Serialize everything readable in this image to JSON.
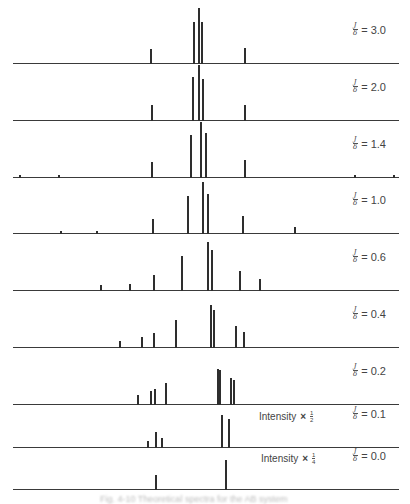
{
  "chart_data": {
    "type": "bar",
    "title": "",
    "xlabel": "",
    "ylabel": "",
    "x_axis": {
      "pixel_range": [
        13,
        399
      ],
      "ticks": "none"
    },
    "grid": false,
    "legend": null,
    "panels": [
      {
        "label_num": "J",
        "label_den": "δ",
        "label_value": "= 3.0",
        "ratio": 3.0,
        "baseline_y": 63,
        "intensity_note": null,
        "peaks": [
          {
            "x": 151,
            "h": 14
          },
          {
            "x": 194,
            "h": 41
          },
          {
            "x": 199,
            "h": 55
          },
          {
            "x": 202,
            "h": 41
          },
          {
            "x": 245,
            "h": 15
          }
        ]
      },
      {
        "label_num": "J",
        "label_den": "δ",
        "label_value": "= 2.0",
        "ratio": 2.0,
        "baseline_y": 120,
        "intensity_note": null,
        "peaks": [
          {
            "x": 152,
            "h": 15
          },
          {
            "x": 193,
            "h": 43
          },
          {
            "x": 199,
            "h": 55
          },
          {
            "x": 203,
            "h": 41
          },
          {
            "x": 245,
            "h": 15
          }
        ]
      },
      {
        "label_num": "J",
        "label_den": "δ",
        "label_value": "= 1.4",
        "ratio": 1.4,
        "baseline_y": 177,
        "intensity_note": null,
        "peaks": [
          {
            "x": 20,
            "h": 2
          },
          {
            "x": 59,
            "h": 2
          },
          {
            "x": 152,
            "h": 15
          },
          {
            "x": 191,
            "h": 42
          },
          {
            "x": 201,
            "h": 55
          },
          {
            "x": 206,
            "h": 44
          },
          {
            "x": 245,
            "h": 17
          },
          {
            "x": 355,
            "h": 2
          },
          {
            "x": 394,
            "h": 2
          }
        ]
      },
      {
        "label_num": "J",
        "label_den": "δ",
        "label_value": "= 1.0",
        "ratio": 1.0,
        "baseline_y": 233,
        "intensity_note": null,
        "peaks": [
          {
            "x": 61,
            "h": 2
          },
          {
            "x": 97,
            "h": 2
          },
          {
            "x": 153,
            "h": 14
          },
          {
            "x": 188,
            "h": 37
          },
          {
            "x": 203,
            "h": 51
          },
          {
            "x": 208,
            "h": 39
          },
          {
            "x": 243,
            "h": 17
          },
          {
            "x": 295,
            "h": 6
          }
        ]
      },
      {
        "label_num": "J",
        "label_den": "δ",
        "label_value": "= 0.6",
        "ratio": 0.6,
        "baseline_y": 290,
        "intensity_note": null,
        "peaks": [
          {
            "x": 101,
            "h": 5
          },
          {
            "x": 130,
            "h": 6
          },
          {
            "x": 154,
            "h": 15
          },
          {
            "x": 182,
            "h": 34
          },
          {
            "x": 208,
            "h": 48
          },
          {
            "x": 212,
            "h": 40
          },
          {
            "x": 240,
            "h": 19
          },
          {
            "x": 260,
            "h": 11
          }
        ]
      },
      {
        "label_num": "J",
        "label_den": "δ",
        "label_value": "= 0.4",
        "ratio": 0.4,
        "baseline_y": 347,
        "intensity_note": null,
        "peaks": [
          {
            "x": 120,
            "h": 6
          },
          {
            "x": 142,
            "h": 10
          },
          {
            "x": 154,
            "h": 14
          },
          {
            "x": 176,
            "h": 27
          },
          {
            "x": 211,
            "h": 42
          },
          {
            "x": 214,
            "h": 37
          },
          {
            "x": 236,
            "h": 21
          },
          {
            "x": 244,
            "h": 15
          }
        ]
      },
      {
        "label_num": "J",
        "label_den": "δ",
        "label_value": "= 0.2",
        "ratio": 0.2,
        "baseline_y": 404,
        "intensity_note": null,
        "peaks": [
          {
            "x": 138,
            "h": 9
          },
          {
            "x": 151,
            "h": 13
          },
          {
            "x": 155,
            "h": 15
          },
          {
            "x": 166,
            "h": 21
          },
          {
            "x": 218,
            "h": 35
          },
          {
            "x": 220,
            "h": 34
          },
          {
            "x": 231,
            "h": 26
          },
          {
            "x": 234,
            "h": 24
          }
        ]
      },
      {
        "label_num": "J",
        "label_den": "δ",
        "label_value": "= 0.1",
        "ratio": 0.1,
        "baseline_y": 447,
        "intensity_note": {
          "text": "Intensity",
          "times": "×",
          "num": "1",
          "den": "2"
        },
        "peaks": [
          {
            "x": 148,
            "h": 6
          },
          {
            "x": 156,
            "h": 15
          },
          {
            "x": 162,
            "h": 9
          },
          {
            "x": 222,
            "h": 32
          },
          {
            "x": 229,
            "h": 28
          }
        ]
      },
      {
        "label_num": "J",
        "label_den": "δ",
        "label_value": "= 0.0",
        "ratio": 0.0,
        "baseline_y": 489,
        "intensity_note": {
          "text": "Intensity",
          "times": "×",
          "num": "1",
          "den": "4"
        },
        "peaks": [
          {
            "x": 156,
            "h": 14
          },
          {
            "x": 226,
            "h": 29
          }
        ]
      }
    ]
  },
  "caption": "Fig. 4-10  Theoretical spectra for the AB system"
}
